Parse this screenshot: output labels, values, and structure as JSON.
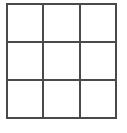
{
  "canvas": {
    "width": 127,
    "height": 133,
    "background_color": "#ffffff"
  },
  "figure": {
    "name": "3x3-grid",
    "type": "grid",
    "rows": 3,
    "columns": 3,
    "cell_count": 9,
    "line_color": "#4a4a4a",
    "line_width_px": 2,
    "cell_fill_color": "#ffffff",
    "bounds": {
      "left": 6,
      "top": 3,
      "width": 111,
      "height": 116
    },
    "vertical_line_x": [
      6.5,
      43,
      80,
      116.5
    ],
    "horizontal_line_y": [
      4,
      40,
      79,
      118
    ],
    "cells": [
      {
        "row": 1,
        "column": 1,
        "label": ""
      },
      {
        "row": 1,
        "column": 2,
        "label": ""
      },
      {
        "row": 1,
        "column": 3,
        "label": ""
      },
      {
        "row": 2,
        "column": 1,
        "label": ""
      },
      {
        "row": 2,
        "column": 2,
        "label": ""
      },
      {
        "row": 2,
        "column": 3,
        "label": ""
      },
      {
        "row": 3,
        "column": 1,
        "label": ""
      },
      {
        "row": 3,
        "column": 2,
        "label": ""
      },
      {
        "row": 3,
        "column": 3,
        "label": ""
      }
    ]
  }
}
